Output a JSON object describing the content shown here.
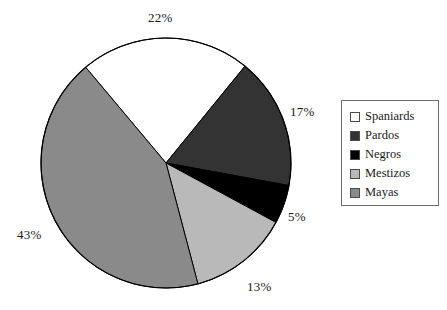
{
  "chart_data": {
    "type": "pie",
    "title": "",
    "categories": [
      "Spaniards",
      "Pardos",
      "Negros",
      "Mestizos",
      "Mayas"
    ],
    "values": [
      22,
      17,
      5,
      13,
      43
    ],
    "value_labels": [
      "22%",
      "17%",
      "5%",
      "13%",
      "43%"
    ],
    "colors": [
      "#ffffff",
      "#333333",
      "#000000",
      "#b9b9b9",
      "#8a8a8a"
    ],
    "legend_position": "right",
    "grid": false,
    "units": "percent",
    "start_angle_deg": -40,
    "direction": "clockwise"
  },
  "legend": {
    "items": [
      {
        "label": "Spaniards",
        "color": "#ffffff"
      },
      {
        "label": "Pardos",
        "color": "#333333"
      },
      {
        "label": "Negros",
        "color": "#000000"
      },
      {
        "label": "Mestizos",
        "color": "#b9b9b9"
      },
      {
        "label": "Mayas",
        "color": "#8a8a8a"
      }
    ]
  },
  "labels": {
    "spaniards_pct": "22%",
    "pardos_pct": "17%",
    "negros_pct": "5%",
    "mestizos_pct": "13%",
    "mayas_pct": "43%"
  },
  "style": {
    "stroke": "#000000",
    "background": "#ffffff"
  }
}
